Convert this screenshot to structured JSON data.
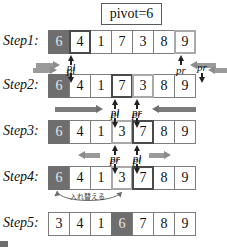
{
  "pivot": {
    "label": "pivot=6"
  },
  "steps": [
    {
      "name": "Step1:",
      "cells": [
        {
          "value": "6",
          "style": "pivot"
        },
        {
          "value": "4",
          "style": "mark-dark"
        },
        {
          "value": "1",
          "style": "plain"
        },
        {
          "value": "7",
          "style": "plain"
        },
        {
          "value": "3",
          "style": "plain"
        },
        {
          "value": "8",
          "style": "plain"
        },
        {
          "value": "9",
          "style": "mark-light"
        }
      ],
      "pointers": [
        {
          "label": "pl",
          "index": 1,
          "dir": "up",
          "place": "below"
        },
        {
          "label": "pr",
          "index": 6,
          "dir": "up",
          "place": "below"
        }
      ],
      "arrows": [
        {
          "label": "scan-right-arrow",
          "dir": "right"
        },
        {
          "label": "scan-left-arrow",
          "dir": "left"
        }
      ]
    },
    {
      "name": "Step2:",
      "cells": [
        {
          "value": "6",
          "style": "pivot"
        },
        {
          "value": "4",
          "style": "plain"
        },
        {
          "value": "1",
          "style": "plain"
        },
        {
          "value": "7",
          "style": "mark-dark"
        },
        {
          "value": "3",
          "style": "mark-light"
        },
        {
          "value": "8",
          "style": "plain"
        },
        {
          "value": "9",
          "style": "plain"
        }
      ],
      "pointers": [
        {
          "label": "pl",
          "index": 1,
          "dir": "down",
          "place": "above"
        },
        {
          "label": "pr",
          "index": 6,
          "dir": "down",
          "place": "above"
        },
        {
          "label": "pl",
          "index": 3,
          "dir": "up",
          "place": "below"
        },
        {
          "label": "pr",
          "index": 4,
          "dir": "up",
          "place": "below"
        }
      ],
      "arrows": [
        {
          "label": "scan-right-arrow",
          "dir": "right"
        },
        {
          "label": "scan-left-arrow",
          "dir": "left"
        }
      ]
    },
    {
      "name": "Step3:",
      "cells": [
        {
          "value": "6",
          "style": "pivot"
        },
        {
          "value": "4",
          "style": "plain"
        },
        {
          "value": "1",
          "style": "plain"
        },
        {
          "value": "3",
          "style": "mark-light"
        },
        {
          "value": "7",
          "style": "mark-dark"
        },
        {
          "value": "8",
          "style": "plain"
        },
        {
          "value": "9",
          "style": "plain"
        }
      ],
      "pointers": [
        {
          "label": "pl",
          "index": 3,
          "dir": "down",
          "place": "above"
        },
        {
          "label": "pr",
          "index": 4,
          "dir": "down",
          "place": "above"
        },
        {
          "label": "pr",
          "index": 3,
          "dir": "up",
          "place": "below"
        },
        {
          "label": "pl",
          "index": 4,
          "dir": "up",
          "place": "below"
        }
      ],
      "arrows": [
        {
          "label": "scan-right-arrow",
          "dir": "right"
        },
        {
          "label": "scan-left-arrow",
          "dir": "left"
        }
      ]
    },
    {
      "name": "Step4:",
      "cells": [
        {
          "value": "6",
          "style": "pivot"
        },
        {
          "value": "4",
          "style": "plain"
        },
        {
          "value": "1",
          "style": "plain"
        },
        {
          "value": "3",
          "style": "mark-light"
        },
        {
          "value": "7",
          "style": "mark-dark"
        },
        {
          "value": "8",
          "style": "plain"
        },
        {
          "value": "9",
          "style": "plain"
        }
      ],
      "pointers": [
        {
          "label": "pr",
          "index": 3,
          "dir": "down",
          "place": "above"
        },
        {
          "label": "pl",
          "index": 4,
          "dir": "down",
          "place": "above"
        }
      ],
      "arrows": [
        {
          "label": "cross-left-arrow",
          "dir": "left"
        },
        {
          "label": "cross-right-arrow",
          "dir": "right"
        }
      ],
      "annotation": "入れ替える"
    },
    {
      "name": "Step5:",
      "cells": [
        {
          "value": "3",
          "style": "plain"
        },
        {
          "value": "4",
          "style": "plain"
        },
        {
          "value": "1",
          "style": "plain"
        },
        {
          "value": "6",
          "style": "pivot"
        },
        {
          "value": "7",
          "style": "plain"
        },
        {
          "value": "8",
          "style": "plain"
        },
        {
          "value": "9",
          "style": "plain"
        }
      ],
      "pointers": [],
      "arrows": []
    }
  ],
  "colors": {
    "pivot_fill": "#6e6e6e",
    "cell_border": "#7d7d7d",
    "mark_dark": "#4a4a4a",
    "mark_light": "#a9a9a9",
    "arrow": "#9a9a9a"
  }
}
